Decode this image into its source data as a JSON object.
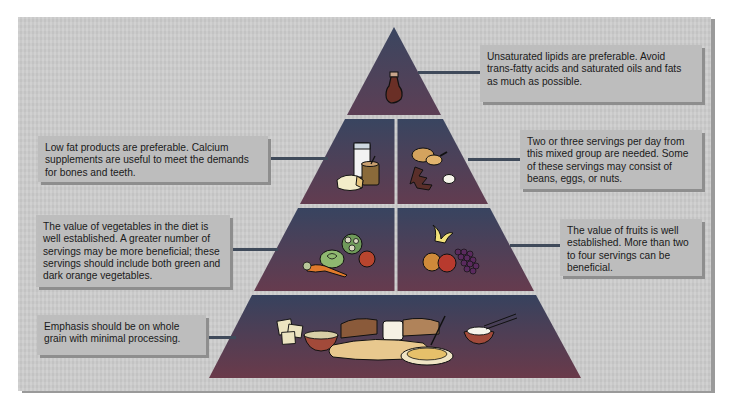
{
  "diagram": {
    "type": "food-guide-pyramid",
    "colors": {
      "background": "#cdcdcd",
      "callout_fill": "#bdbdbd",
      "pyramid_top": "#3d4a62",
      "pyramid_bottom": "#6a3a48",
      "divider": "#d9d9d9",
      "leader_line": "#3f4a5a"
    },
    "tiers": [
      {
        "level": 1,
        "sections": [
          {
            "group": "fats-oils",
            "icon": "oil-bottle-icon",
            "callout": "Unsaturated lipids are preferable. Avoid trans-fatty acids and saturated oils and fats as much as possible."
          }
        ]
      },
      {
        "level": 2,
        "sections": [
          {
            "group": "dairy",
            "icon": "milk-cheese-icon",
            "callout": "Low fat products are preferable.  Calcium supplements are useful to meet the demands for bones and teeth."
          },
          {
            "group": "meat-beans-eggs-nuts",
            "icon": "poultry-meat-egg-icon",
            "callout": "Two or three servings per day from this mixed group are needed. Some of these servings may consist of beans, eggs, or nuts."
          }
        ]
      },
      {
        "level": 3,
        "sections": [
          {
            "group": "vegetables",
            "icon": "vegetables-icon",
            "callout": "The value of vegetables in the diet is well established.  A greater number of servings may be more beneficial; these servings should include both green and dark orange vegetables."
          },
          {
            "group": "fruits",
            "icon": "fruits-icon",
            "callout": "The value of fruits is well established.  More than two to four servings can be beneficial."
          }
        ]
      },
      {
        "level": 4,
        "sections": [
          {
            "group": "grains",
            "icon": "bread-cereal-pasta-rice-icon",
            "callout": "Emphasis should be on whole grain with minimal processing."
          }
        ]
      }
    ]
  }
}
